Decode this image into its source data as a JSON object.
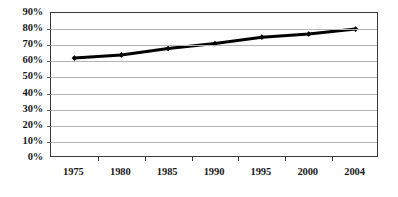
{
  "chart_data": {
    "type": "line",
    "title": "",
    "subtitle": "",
    "xlabel": "",
    "ylabel": "",
    "categories": [
      "1975",
      "1980",
      "1985",
      "1990",
      "1995",
      "2000",
      "2004"
    ],
    "values": [
      62,
      64,
      68,
      71,
      75,
      77,
      80
    ],
    "series": [
      {
        "name": "",
        "values": [
          62,
          64,
          68,
          71,
          75,
          77,
          80
        ]
      }
    ],
    "ylim": [
      0,
      90
    ],
    "y_tick_values": [
      90,
      80,
      70,
      60,
      50,
      40,
      30,
      20,
      10,
      0
    ],
    "y_tick_labels": [
      "90%",
      "80%",
      "70%",
      "60%",
      "50%",
      "40%",
      "30%",
      "20%",
      "10%",
      "0%"
    ],
    "x_tick_labels": [
      "1975",
      "1980",
      "1985",
      "1990",
      "1995",
      "2000",
      "2004"
    ],
    "grid": true,
    "grid_axis": "y",
    "legend": false,
    "legend_position": "none",
    "marker": "diamond",
    "annotations": []
  },
  "style": {
    "line_color": "#000000",
    "marker_color": "#000000",
    "grid_color": "#b4b4b4",
    "frame_color": "#3a3a3a",
    "plot_background": "#ffffff",
    "page_background": "#ffffff",
    "tick_label_color": "#1a1a1a"
  }
}
